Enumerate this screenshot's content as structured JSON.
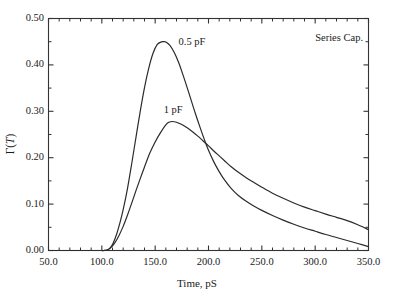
{
  "chart_data": {
    "type": "line",
    "title": "",
    "xlabel": "Time, pS",
    "ylabel": "Γ(T)",
    "xlim": [
      50.0,
      350.0
    ],
    "ylim": [
      0.0,
      0.5
    ],
    "grid": false,
    "legend_position": "inline-annotations",
    "xticks": [
      "50.0",
      "100.0",
      "150.0",
      "200.0",
      "250.0",
      "300.0",
      "350.0"
    ],
    "xtick_values": [
      50.0,
      100.0,
      150.0,
      200.0,
      250.0,
      300.0,
      350.0
    ],
    "xminor_count": 4,
    "yticks": [
      "0.00",
      "0.10",
      "0.20",
      "0.30",
      "0.40",
      "0.50"
    ],
    "ytick_values": [
      0.0,
      0.1,
      0.2,
      0.3,
      0.4,
      0.5
    ],
    "yminor_count": 1,
    "annotations": [
      {
        "text": "0.5 pF",
        "x": 172,
        "y": 0.447
      },
      {
        "text": "1 pF",
        "x": 158,
        "y": 0.3
      },
      {
        "text": "Series Cap.",
        "x": 300,
        "y": 0.455
      }
    ],
    "series": [
      {
        "name": "0.5 pF",
        "color": "#2b2b2b",
        "peak_x": 158,
        "peak_y": 0.45,
        "x": [
          50,
          60,
          70,
          80,
          90,
          98,
          102,
          105,
          108,
          111,
          114,
          117,
          120,
          124,
          128,
          132,
          136,
          140,
          144,
          148,
          152,
          156,
          158,
          160,
          164,
          168,
          172,
          176,
          180,
          184,
          188,
          192,
          196,
          200,
          205,
          210,
          215,
          221,
          228,
          235,
          242,
          250,
          260,
          270,
          280,
          290,
          300,
          310,
          320,
          330,
          340,
          350
        ],
        "y": [
          0.0,
          0.0,
          0.0,
          0.0,
          0.0,
          0.0,
          0.0,
          0.001,
          0.006,
          0.018,
          0.036,
          0.06,
          0.088,
          0.133,
          0.187,
          0.244,
          0.3,
          0.351,
          0.393,
          0.425,
          0.444,
          0.4497,
          0.45,
          0.4492,
          0.4415,
          0.426,
          0.405,
          0.379,
          0.351,
          0.322,
          0.293,
          0.266,
          0.24,
          0.216,
          0.191,
          0.17,
          0.152,
          0.1345,
          0.1185,
          0.1065,
          0.0965,
          0.0865,
          0.0755,
          0.0655,
          0.0565,
          0.0485,
          0.0415,
          0.0345,
          0.028,
          0.0215,
          0.015,
          0.0085
        ]
      },
      {
        "name": "1 pF",
        "color": "#2b2b2b",
        "peak_x": 163,
        "peak_y": 0.278,
        "x": [
          50,
          60,
          70,
          80,
          90,
          98,
          102,
          105,
          108,
          112,
          116,
          120,
          124,
          128,
          132,
          136,
          140,
          145,
          150,
          155,
          160,
          163,
          166,
          170,
          175,
          180,
          185,
          190,
          195,
          200,
          205,
          210,
          215,
          221,
          228,
          235,
          242,
          250,
          260,
          270,
          280,
          290,
          300,
          310,
          320,
          330,
          340,
          350
        ],
        "y": [
          0.0,
          0.0,
          0.0,
          0.0,
          0.0,
          0.0,
          0.0,
          0.001,
          0.005,
          0.016,
          0.032,
          0.052,
          0.076,
          0.102,
          0.129,
          0.155,
          0.18,
          0.21,
          0.234,
          0.254,
          0.271,
          0.2765,
          0.278,
          0.2765,
          0.2715,
          0.2645,
          0.256,
          0.2465,
          0.236,
          0.2255,
          0.2145,
          0.204,
          0.1935,
          0.181,
          0.1685,
          0.1575,
          0.1475,
          0.1365,
          0.1235,
          0.1125,
          0.1025,
          0.0935,
          0.086,
          0.0785,
          0.0715,
          0.0645,
          0.0555,
          0.045
        ]
      }
    ]
  },
  "axes": {
    "x_title": "Time, pS",
    "y_title_prefix": "Γ(",
    "y_title_var": "T",
    "y_title_suffix": ")"
  }
}
